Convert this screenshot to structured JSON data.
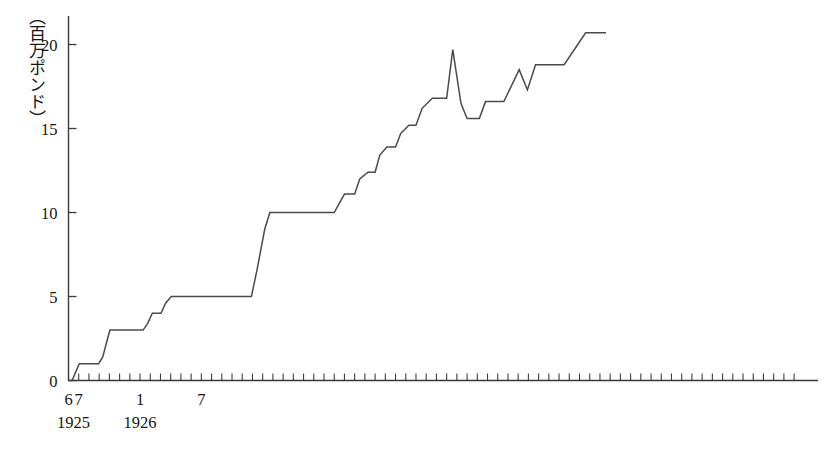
{
  "chart_data": {
    "type": "line",
    "title": "",
    "subtitle": "",
    "ylabel": "（百万ポンド）",
    "xlabel": "",
    "ylim": [
      0,
      22.4
    ],
    "xlim": [
      6,
      78
    ],
    "grid": false,
    "legend": null,
    "y_ticks": [
      0,
      5,
      10,
      15,
      20
    ],
    "y_tick_labels": [
      "0",
      "5",
      "10",
      "15",
      "20"
    ],
    "x_tick_labels": [
      {
        "value": 6,
        "label": "6"
      },
      {
        "value": 7,
        "label": "7"
      },
      {
        "value": 13,
        "label": "1"
      },
      {
        "value": 19,
        "label": "7"
      }
    ],
    "x_year_labels": [
      {
        "value": 6.5,
        "label": "1925"
      },
      {
        "value": 13,
        "label": "1926"
      }
    ],
    "x_tick_step_months": 1,
    "x_tick_count": 72,
    "series": [
      {
        "name": "cumulative",
        "points": [
          [
            6.0,
            0.0
          ],
          [
            6.35,
            0.0
          ],
          [
            7.05,
            1.0
          ],
          [
            8.95,
            1.0
          ],
          [
            9.35,
            1.4
          ],
          [
            10.05,
            3.0
          ],
          [
            13.3,
            3.0
          ],
          [
            13.75,
            3.4
          ],
          [
            14.2,
            4.0
          ],
          [
            15.05,
            4.0
          ],
          [
            15.5,
            4.6
          ],
          [
            16.05,
            5.0
          ],
          [
            23.9,
            5.0
          ],
          [
            24.45,
            6.6
          ],
          [
            25.2,
            9.0
          ],
          [
            25.7,
            10.0
          ],
          [
            32.0,
            10.0
          ],
          [
            32.55,
            10.6
          ],
          [
            33.0,
            11.1
          ],
          [
            34.0,
            11.1
          ],
          [
            34.5,
            12.0
          ],
          [
            35.3,
            12.4
          ],
          [
            36.0,
            12.4
          ],
          [
            36.45,
            13.4
          ],
          [
            37.15,
            13.9
          ],
          [
            38.0,
            13.9
          ],
          [
            38.5,
            14.7
          ],
          [
            39.3,
            15.2
          ],
          [
            40.0,
            15.2
          ],
          [
            40.6,
            16.2
          ],
          [
            41.6,
            16.8
          ],
          [
            43.0,
            16.8
          ],
          [
            43.6,
            19.7
          ],
          [
            44.4,
            16.5
          ],
          [
            45.0,
            15.6
          ],
          [
            46.2,
            15.6
          ],
          [
            46.8,
            16.6
          ],
          [
            48.6,
            16.6
          ],
          [
            50.1,
            18.5
          ],
          [
            50.9,
            17.3
          ],
          [
            51.7,
            18.8
          ],
          [
            54.5,
            18.8
          ],
          [
            56.6,
            20.7
          ],
          [
            58.6,
            20.7
          ]
        ]
      }
    ],
    "annotations": []
  },
  "colors": {
    "line": "#4a4a4a",
    "axis": "#3b3b3b",
    "text": "#141414",
    "background": "#ffffff"
  }
}
